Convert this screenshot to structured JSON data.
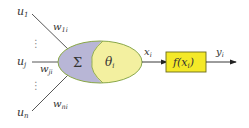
{
  "diagram": {
    "title": "",
    "inputs": [
      {
        "label": "u",
        "sub": "1",
        "weight": "w",
        "weight_sub": "1i"
      },
      {
        "label": "u",
        "sub": "j",
        "weight": "w",
        "weight_sub": "ji"
      },
      {
        "label": "u",
        "sub": "n",
        "weight": "w",
        "weight_sub": "ni"
      }
    ],
    "ellipsis": "⋮",
    "summation": "Σ",
    "threshold": {
      "label": "θ",
      "sub": "i"
    },
    "net_output": {
      "label": "x",
      "sub": "i"
    },
    "activation": {
      "label": "f(x",
      "sub": "i",
      "close": ")"
    },
    "output": {
      "label": "y",
      "sub": "i"
    },
    "colors": {
      "sum_fill": "#b8b6d6",
      "threshold_fill": "#f3f0a0",
      "ellipse_stroke": "#8aa84a",
      "activation_fill": "#f4e928",
      "activation_stroke": "#6b6a1a",
      "line": "#333333"
    }
  }
}
